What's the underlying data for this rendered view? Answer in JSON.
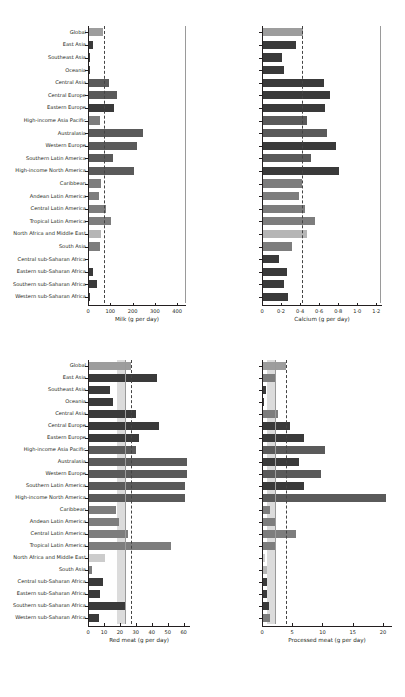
{
  "figure": {
    "caption": "Figure: Intake of selected dietary factors by region",
    "regions": [
      "Global",
      "East Asia",
      "Southeast Asia",
      "Oceania",
      "Central Asia",
      "Central Europe",
      "Eastern Europe",
      "High-income Asia Pacific",
      "Australasia",
      "Western Europe",
      "Southern Latin America",
      "High-income North America",
      "Caribbean",
      "Andean Latin America",
      "Central Latin America",
      "Tropical Latin America",
      "North Africa and Middle East",
      "South Asia",
      "Central sub-Saharan Africa",
      "Eastern sub-Saharan Africa",
      "Southern sub-Saharan Africa",
      "Western sub-Saharan Africa"
    ],
    "colors": {
      "global": "#9d9d9d",
      "dark": "#3a3a3a",
      "mid_dark": "#5a5a5a",
      "mid": "#7d7d7d",
      "light": "#b5b5b5",
      "lighter": "#cccccc",
      "band": "#dcdcdc",
      "reference_dashed": "#444444",
      "reference_solid": "#9a9a9a",
      "axis": "#231f20"
    }
  },
  "chart_data": [
    {
      "id": "milk",
      "type": "bar",
      "orientation": "horizontal",
      "title": "",
      "xlabel": "Milk (g per day)",
      "ylabel": "",
      "xlim": [
        0,
        440
      ],
      "xticks": [
        0,
        100,
        200,
        300,
        400
      ],
      "xticklabels": [
        "0",
        "100",
        "200",
        "300",
        "400"
      ],
      "grid": false,
      "legend": "none",
      "reference_dashed": 70,
      "reference_solid": 435,
      "categories": [
        "Global",
        "East Asia",
        "Southeast Asia",
        "Oceania",
        "Central Asia",
        "Central Europe",
        "Eastern Europe",
        "High-income Asia Pacific",
        "Australasia",
        "Western Europe",
        "Southern Latin America",
        "High-income North America",
        "Caribbean",
        "Andean Latin America",
        "Central Latin America",
        "Tropical Latin America",
        "North Africa and Middle East",
        "South Asia",
        "Central sub-Saharan Africa",
        "Eastern sub-Saharan Africa",
        "Southern sub-Saharan Africa",
        "Western sub-Saharan Africa"
      ],
      "values": [
        68,
        22,
        8,
        10,
        96,
        130,
        115,
        55,
        248,
        218,
        110,
        207,
        60,
        48,
        82,
        105,
        58,
        52,
        6,
        22,
        42,
        10
      ],
      "bar_shades": [
        "global",
        "dark",
        "dark",
        "dark",
        "mid_dark",
        "mid_dark",
        "dark",
        "mid",
        "mid_dark",
        "mid_dark",
        "mid_dark",
        "mid_dark",
        "mid",
        "mid",
        "mid",
        "mid",
        "light",
        "mid",
        "dark",
        "dark",
        "dark",
        "dark"
      ]
    },
    {
      "id": "calcium",
      "type": "bar",
      "orientation": "horizontal",
      "title": "",
      "xlabel": "Calcium (g per day)",
      "ylabel": "",
      "xlim": [
        0,
        1.26
      ],
      "xticks": [
        0,
        0.2,
        0.4,
        0.6,
        0.8,
        1.0,
        1.2
      ],
      "xticklabels": [
        "0",
        "0·2",
        "0·4",
        "0·6",
        "0·8",
        "1·0",
        "1·2"
      ],
      "grid": false,
      "legend": "none",
      "reference_dashed": 0.425,
      "reference_solid": 1.235,
      "categories": [
        "Global",
        "East Asia",
        "Southeast Asia",
        "Oceania",
        "Central Asia",
        "Central Europe",
        "Eastern Europe",
        "High-income Asia Pacific",
        "Australasia",
        "Western Europe",
        "Southern Latin America",
        "High-income North America",
        "Caribbean",
        "Andean Latin America",
        "Central Latin America",
        "Tropical Latin America",
        "North Africa and Middle East",
        "South Asia",
        "Central sub-Saharan Africa",
        "Eastern sub-Saharan Africa",
        "Southern sub-Saharan Africa",
        "Western sub-Saharan Africa"
      ],
      "values": [
        0.43,
        0.36,
        0.21,
        0.23,
        0.65,
        0.71,
        0.66,
        0.47,
        0.68,
        0.78,
        0.51,
        0.81,
        0.42,
        0.39,
        0.45,
        0.56,
        0.47,
        0.31,
        0.18,
        0.26,
        0.23,
        0.27
      ],
      "bar_shades": [
        "global",
        "dark",
        "dark",
        "dark",
        "dark",
        "dark",
        "dark",
        "mid_dark",
        "mid_dark",
        "dark",
        "mid_dark",
        "dark",
        "mid",
        "mid",
        "mid",
        "mid",
        "light",
        "mid",
        "dark",
        "dark",
        "dark",
        "dark"
      ]
    },
    {
      "id": "red_meat",
      "type": "bar",
      "orientation": "horizontal",
      "title": "",
      "xlabel": "Red meat (g per day)",
      "ylabel": "",
      "xlim": [
        0,
        64
      ],
      "xticks": [
        0,
        10,
        20,
        30,
        40,
        50,
        60
      ],
      "xticklabels": [
        "0",
        "10",
        "20",
        "30",
        "40",
        "50",
        "60"
      ],
      "grid": false,
      "legend": "none",
      "reference_dashed": 27,
      "reference_solid": 23,
      "band_range": [
        18.5,
        23
      ],
      "categories": [
        "Global",
        "East Asia",
        "Southeast Asia",
        "Oceania",
        "Central Asia",
        "Central Europe",
        "Eastern Europe",
        "High-income Asia Pacific",
        "Australasia",
        "Western Europe",
        "Southern Latin America",
        "High-income North America",
        "Caribbean",
        "Andean Latin America",
        "Central Latin America",
        "Tropical Latin America",
        "North Africa and Middle East",
        "South Asia",
        "Central sub-Saharan Africa",
        "Eastern sub-Saharan Africa",
        "Southern sub-Saharan Africa",
        "Western sub-Saharan Africa"
      ],
      "values": [
        27,
        43,
        13.5,
        15.5,
        30,
        44.5,
        32,
        30,
        62,
        62,
        61,
        61,
        17.5,
        19.5,
        25,
        52,
        10.5,
        2.5,
        9.5,
        7.5,
        23,
        7
      ],
      "bar_shades": [
        "global",
        "dark",
        "dark",
        "dark",
        "dark",
        "dark",
        "dark",
        "mid_dark",
        "mid_dark",
        "mid_dark",
        "mid_dark",
        "mid_dark",
        "mid",
        "mid",
        "mid",
        "mid",
        "lighter",
        "mid",
        "dark",
        "dark",
        "dark",
        "dark"
      ]
    },
    {
      "id": "processed_meat",
      "type": "bar",
      "orientation": "horizontal",
      "title": "",
      "xlabel": "Processed meat (g per day)",
      "ylabel": "",
      "xlim": [
        0,
        21.5
      ],
      "xticks": [
        0,
        5,
        10,
        15,
        20
      ],
      "xticklabels": [
        "0",
        "5",
        "10",
        "15",
        "20"
      ],
      "grid": false,
      "legend": "none",
      "reference_dashed": 4,
      "reference_solid": 2.1,
      "band_range": [
        0.9,
        2.1
      ],
      "categories": [
        "Global",
        "East Asia",
        "Southeast Asia",
        "Oceania",
        "Central Asia",
        "Central Europe",
        "Eastern Europe",
        "High-income Asia Pacific",
        "Australasia",
        "Western Europe",
        "Southern Latin America",
        "High-income North America",
        "Caribbean",
        "Andean Latin America",
        "Central Latin America",
        "Tropical Latin America",
        "North Africa and Middle East",
        "South Asia",
        "Central sub-Saharan Africa",
        "Eastern sub-Saharan Africa",
        "Southern sub-Saharan Africa",
        "Western sub-Saharan Africa"
      ],
      "values": [
        4.0,
        2.1,
        0.6,
        0.35,
        2.6,
        4.7,
        7.0,
        10.5,
        6.2,
        9.8,
        6.9,
        20.5,
        1.4,
        2.2,
        5.6,
        2.3,
        0.55,
        0.9,
        0.8,
        0.75,
        1.1,
        1.4
      ],
      "bar_shades": [
        "global",
        "mid",
        "dark",
        "dark",
        "mid",
        "dark",
        "dark",
        "mid_dark",
        "dark",
        "mid_dark",
        "dark",
        "mid_dark",
        "mid",
        "mid",
        "mid",
        "mid",
        "lighter",
        "light",
        "dark",
        "dark",
        "dark",
        "mid"
      ]
    }
  ]
}
